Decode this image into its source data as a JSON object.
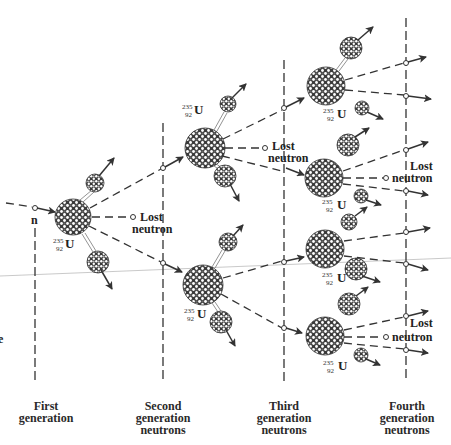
{
  "diagram": {
    "type": "nuclear fission chain reaction",
    "incoming_neutron_label": "n",
    "isotope": {
      "mass_number": "235",
      "atomic_number": "92",
      "symbol": "U"
    },
    "lost_neutron_label": {
      "line1": "Lost",
      "line2": "neutron"
    },
    "partial_left_text": "e",
    "generations": [
      {
        "line1": "First",
        "line2": "generation",
        "line3": ""
      },
      {
        "line1": "Second",
        "line2": "generation",
        "line3": "neutrons"
      },
      {
        "line1": "Third",
        "line2": "generation",
        "line3": "neutrons"
      },
      {
        "line1": "Fourth",
        "line2": "generation",
        "line3": "neutrons"
      }
    ],
    "colors": {
      "line": "#333333",
      "nucleus_dark": "#3a3a3a",
      "nucleus_light": "#ffffff",
      "background": "#ffffff"
    }
  }
}
